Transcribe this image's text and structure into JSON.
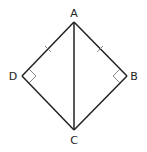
{
  "diagram": {
    "type": "geometry-kite",
    "vertices": [
      {
        "label": "A",
        "x": 74,
        "y": 22
      },
      {
        "label": "B",
        "x": 127,
        "y": 76
      },
      {
        "label": "C",
        "x": 74,
        "y": 130
      },
      {
        "label": "D",
        "x": 22,
        "y": 76
      }
    ],
    "segments": [
      "AB",
      "BC",
      "CD",
      "DA",
      "AC"
    ],
    "tick_marks": [
      "AD",
      "AB"
    ],
    "right_angles": [
      "D",
      "B"
    ],
    "labels": {
      "a": "A",
      "b": "B",
      "c": "C",
      "d": "D"
    }
  }
}
